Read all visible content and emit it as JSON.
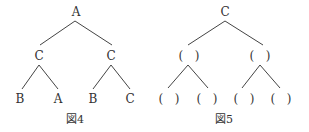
{
  "figures": [
    {
      "caption": "図4",
      "root": "A",
      "level1": [
        "C",
        "C"
      ],
      "level2": [
        "B",
        "A",
        "B",
        "C"
      ]
    },
    {
      "caption": "図5",
      "root": "C",
      "level1": [
        "(   )",
        "(   )"
      ],
      "level2": [
        "(   )",
        "(   )",
        "(   )",
        "(   )"
      ]
    }
  ]
}
